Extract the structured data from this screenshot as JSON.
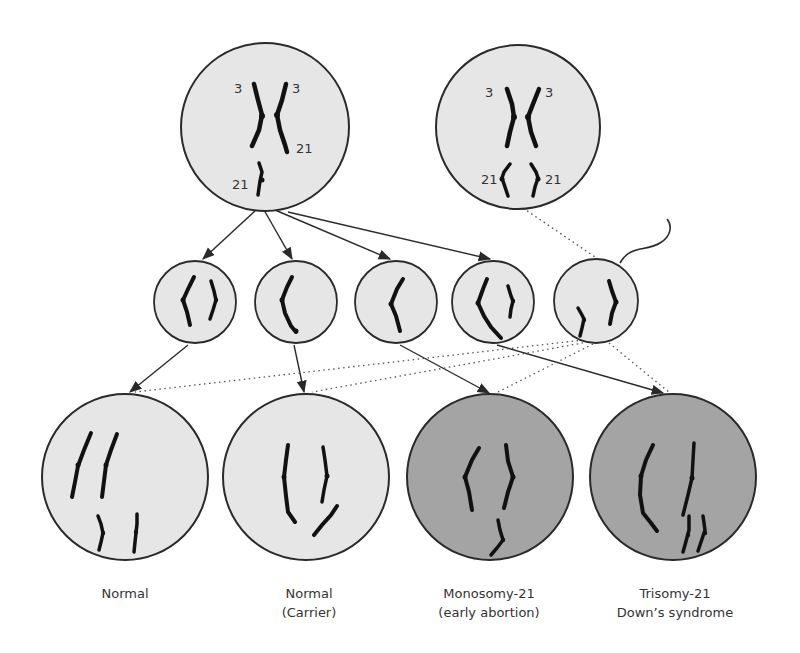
{
  "diagram": {
    "colors": {
      "cell_fill": "#e6e6e6",
      "abnormal_fill": "#a4a4a4",
      "outline": "#2a2a2a",
      "chromosome": "#111111",
      "label": "#333333"
    },
    "parents": [
      {
        "id": "carrier-parent",
        "chromosome_labels": [
          "3",
          "3",
          "21",
          "21"
        ]
      },
      {
        "id": "normal-parent",
        "chromosome_labels": [
          "3",
          "3",
          "21",
          "21"
        ]
      }
    ],
    "gametes": [
      {
        "id": "gamete-1"
      },
      {
        "id": "gamete-2"
      },
      {
        "id": "gamete-3"
      },
      {
        "id": "gamete-4"
      },
      {
        "id": "sperm"
      }
    ],
    "outcomes": [
      {
        "id": "normal",
        "label_line1": "Normal",
        "label_line2": ""
      },
      {
        "id": "carrier",
        "label_line1": "Normal",
        "label_line2": "(Carrier)"
      },
      {
        "id": "monosomy",
        "label_line1": "Monosomy-21",
        "label_line2": "(early abortion)"
      },
      {
        "id": "trisomy",
        "label_line1": "Trisomy-21",
        "label_line2": "Down’s syndrome"
      }
    ]
  }
}
